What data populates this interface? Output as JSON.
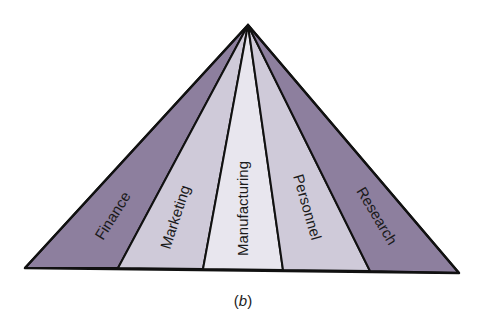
{
  "diagram": {
    "type": "pyramid",
    "caption": "(b)",
    "caption_prefix": "(",
    "caption_letter": "b",
    "caption_suffix": ")",
    "segments": [
      {
        "label": "Finance",
        "color": "#8d7f9e"
      },
      {
        "label": "Marketing",
        "color": "#cfcad9"
      },
      {
        "label": "Manufacturing",
        "color": "#e8e6ee"
      },
      {
        "label": "Personnel",
        "color": "#cfcad9"
      },
      {
        "label": "Research",
        "color": "#8d7f9e"
      }
    ],
    "outline_color": "#111111"
  }
}
